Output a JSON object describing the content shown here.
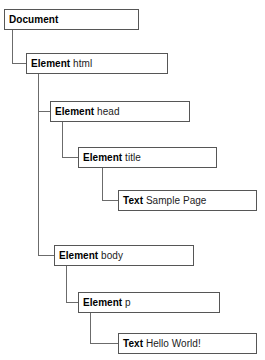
{
  "diagram": {
    "line_color": "#6b6b6b",
    "box_border_color": "#565656",
    "background": "#ffffff",
    "nodes": [
      {
        "id": "document",
        "type": "Document",
        "value": "",
        "x": 4,
        "y": 9,
        "width": 135,
        "depth": 0
      },
      {
        "id": "element-html",
        "type": "Element",
        "value": "html",
        "x": 26,
        "y": 53,
        "width": 142,
        "depth": 1
      },
      {
        "id": "element-head",
        "type": "Element",
        "value": "head",
        "x": 50,
        "y": 101,
        "width": 140,
        "depth": 2
      },
      {
        "id": "element-title",
        "type": "Element",
        "value": "title",
        "x": 78,
        "y": 147,
        "width": 139,
        "depth": 3
      },
      {
        "id": "text-sample-page",
        "type": "Text",
        "value": "Sample Page",
        "x": 118,
        "y": 190,
        "width": 139,
        "depth": 4
      },
      {
        "id": "element-body",
        "type": "Element",
        "value": "body",
        "x": 54,
        "y": 245,
        "width": 140,
        "depth": 2
      },
      {
        "id": "element-p",
        "type": "Element",
        "value": "p",
        "x": 78,
        "y": 292,
        "width": 142,
        "depth": 3
      },
      {
        "id": "text-hello-world",
        "type": "Text",
        "value": "Hello World!",
        "x": 118,
        "y": 333,
        "width": 139,
        "depth": 4
      }
    ],
    "connectors": [
      {
        "id": "document-to-html",
        "from": "document",
        "to": "element-html",
        "vx": 12,
        "vy1": 30,
        "vy2": 63,
        "hx2": 26
      },
      {
        "id": "html-to-head",
        "from": "element-html",
        "to": "element-head",
        "vx": 38,
        "vy1": 74,
        "vy2": 111,
        "hx2": 50
      },
      {
        "id": "html-to-body",
        "from": "element-html",
        "to": "element-body",
        "vx": 38,
        "vy1": 74,
        "vy2": 255,
        "hx2": 54
      },
      {
        "id": "head-to-title",
        "from": "element-head",
        "to": "element-title",
        "vx": 62,
        "vy1": 122,
        "vy2": 157,
        "hx2": 78
      },
      {
        "id": "title-to-text",
        "from": "element-title",
        "to": "text-sample-page",
        "vx": 102,
        "vy1": 168,
        "vy2": 200,
        "hx2": 118
      },
      {
        "id": "body-to-p",
        "from": "element-body",
        "to": "element-p",
        "vx": 66,
        "vy1": 266,
        "vy2": 302,
        "hx2": 78
      },
      {
        "id": "p-to-text",
        "from": "element-p",
        "to": "text-hello-world",
        "vx": 90,
        "vy1": 313,
        "vy2": 343,
        "hx2": 118
      }
    ]
  }
}
